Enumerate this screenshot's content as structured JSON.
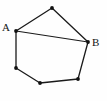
{
  "figure": {
    "type": "polygon-diagram",
    "background_color": "#fefefe",
    "stroke_color": "#1a1a1a",
    "vertex_color": "#111111",
    "width": 107,
    "height": 101,
    "labels": {
      "a": "A",
      "b": "B"
    },
    "vertices": [
      {
        "id": "top",
        "x": 52,
        "y": 8,
        "label": ""
      },
      {
        "id": "a",
        "x": 16,
        "y": 31,
        "label": "A"
      },
      {
        "id": "bottom-left",
        "x": 16,
        "y": 68,
        "label": ""
      },
      {
        "id": "bottom",
        "x": 40,
        "y": 83,
        "label": ""
      },
      {
        "id": "bottom-right",
        "x": 78,
        "y": 79,
        "label": ""
      },
      {
        "id": "b",
        "x": 88,
        "y": 42,
        "label": "B"
      }
    ],
    "outline_path": "M52,8 L88,42 L78,79 L40,83 L16,68 L16,31 Z",
    "chord_path": "M16,31 L88,42",
    "chord_endpoints": [
      "A",
      "B"
    ]
  }
}
